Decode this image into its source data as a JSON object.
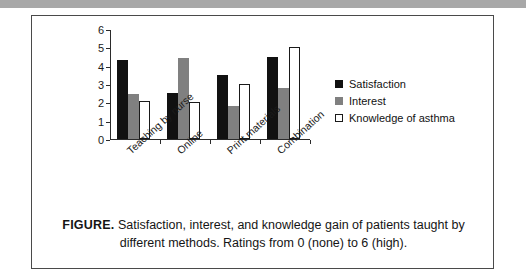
{
  "figure": {
    "caption_label": "FIGURE.",
    "caption_text": "Satisfaction, interest, and knowledge gain of patients taught by different methods. Ratings from 0 (none) to 6 (high)."
  },
  "chart_data": {
    "type": "bar",
    "title": "",
    "xlabel": "",
    "ylabel": "",
    "ylim": [
      0,
      6
    ],
    "yticks": [
      0,
      1,
      2,
      3,
      4,
      5,
      6
    ],
    "grid": false,
    "legend_position": "right",
    "categories": [
      "Teaching by nurse",
      "Online",
      "Print materials",
      "Combination"
    ],
    "series": [
      {
        "name": "Satisfaction",
        "color": "#111111",
        "values": [
          4.3,
          2.5,
          3.5,
          4.5
        ]
      },
      {
        "name": "Interest",
        "color": "#808080",
        "values": [
          2.45,
          4.4,
          1.8,
          2.8
        ]
      },
      {
        "name": "Knowledge of asthma",
        "color": "#ffffff",
        "values": [
          2.05,
          2.0,
          3.0,
          5.0
        ]
      }
    ]
  }
}
